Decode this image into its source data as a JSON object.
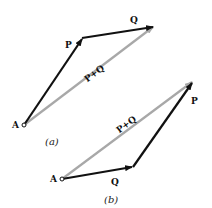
{
  "figure_a": {
    "caption": "(a)",
    "origin_label": "A",
    "vector1_label": "P",
    "vector2_label": "Q",
    "resultant_label": "P+Q"
  },
  "figure_b": {
    "caption": "(b)",
    "origin_label": "A",
    "vector1_label": "Q",
    "vector2_label": "P",
    "resultant_label": "P+Q"
  },
  "colors": {
    "vector": "#111111",
    "resultant": "#a8a8a8"
  }
}
